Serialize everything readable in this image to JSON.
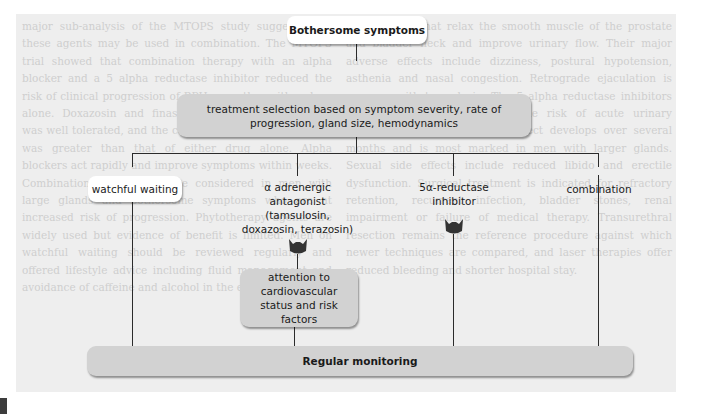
{
  "diagram": {
    "top": {
      "text": "Bothersome symptoms"
    },
    "selection": {
      "text": "treatment selection based on symptom severity, rate of progression, gland size, hemodynamics"
    },
    "branches": [
      {
        "id": "watchful",
        "text": "watchful waiting",
        "style": "box"
      },
      {
        "id": "alpha",
        "text": "α adrenergic antagonist (tamsulosin, doxazosin, terazosin)",
        "style": "label",
        "icon": "prostate-icon"
      },
      {
        "id": "five-alpha",
        "text": "5α-reductase inhibitor",
        "style": "label",
        "icon": "prostate-icon"
      },
      {
        "id": "combination",
        "text": "combination",
        "style": "label"
      }
    ],
    "cardio": {
      "text": "attention to cardiovascular status and risk factors"
    },
    "monitoring": {
      "text": "Regular monitoring"
    },
    "colors": {
      "box_grey": "#d2d2d2",
      "box_white": "#ffffff",
      "line": "#2b2b2b",
      "icon": "#333333",
      "page_bg": "#eeeeee"
    }
  },
  "background_text": {
    "col1": "major sub-analysis of the MTOPS study suggests that these agents may be used in combination. The MTOPS trial showed that combination therapy with an alpha blocker and a 5 alpha reductase inhibitor reduced the risk of clinical progression of BPH more than either drug alone. Doxazosin and finasteride combination therapy was well tolerated, and the combined effect on symptoms was greater than that of either drug alone. Alpha blockers act rapidly and improve symptoms within weeks. Combination therapy may be considered in men with large glands and bothersome symptoms who are at increased risk of progression. Phytotherapy agents are widely used but evidence of benefit is limited. Men on watchful waiting should be reviewed regularly and offered lifestyle advice including fluid management and avoidance of caffeine and alcohol in the evening.",
    "col2": "preparations that relax the smooth muscle of the prostate and bladder neck and improve urinary flow. Their major adverse effects include dizziness, postural hypotension, asthenia and nasal congestion. Retrograde ejaculation is common with tamsulosin. The 5 alpha reductase inhibitors reduce prostate volume and the risk of acute urinary retention and surgery. Their effect develops over several months and is most marked in men with larger glands. Sexual side effects include reduced libido and erectile dysfunction. Surgical treatment is indicated for refractory retention, recurrent infection, bladder stones, renal impairment or failure of medical therapy. Transurethral resection remains the reference procedure against which newer techniques are compared, and laser therapies offer reduced bleeding and shorter hospital stay."
  }
}
